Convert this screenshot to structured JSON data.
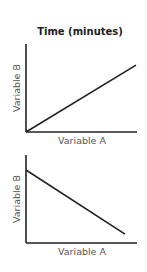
{
  "title": "Time (minutes)",
  "chart_data": [
    {
      "type": "line",
      "title": "Time (minutes)",
      "xlabel": "Variable A",
      "ylabel": "Variable B",
      "grid": false,
      "xlim": [
        0,
        1
      ],
      "ylim": [
        0,
        1
      ],
      "series": [
        {
          "name": "positive relationship",
          "x": [
            0,
            1
          ],
          "y": [
            0,
            0.76
          ]
        }
      ]
    },
    {
      "type": "line",
      "title": "",
      "xlabel": "Variable A",
      "ylabel": "Variable B",
      "grid": false,
      "xlim": [
        0,
        1
      ],
      "ylim": [
        0,
        1
      ],
      "series": [
        {
          "name": "negative relationship",
          "x": [
            0,
            0.9
          ],
          "y": [
            0.83,
            0.1
          ]
        }
      ]
    }
  ]
}
